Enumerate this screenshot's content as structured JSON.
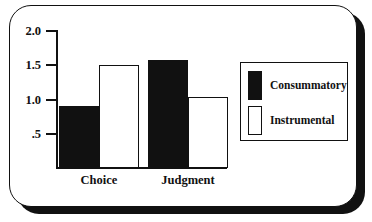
{
  "chart_data": {
    "type": "bar",
    "title": "",
    "xlabel": "",
    "ylabel": "",
    "categories": [
      "Choice",
      "Judgment"
    ],
    "series": [
      {
        "name": "Consummatory",
        "fill": "black",
        "values": [
          0.9,
          1.58
        ]
      },
      {
        "name": "Instrumental",
        "fill": "white",
        "values": [
          1.5,
          1.03
        ]
      }
    ],
    "ylim": [
      0,
      2.0
    ],
    "yticks": [
      2.0,
      1.5,
      1.0,
      0.5
    ],
    "ytick_labels": [
      "2.0",
      "1.5",
      "1.0",
      ".5"
    ],
    "grid": false,
    "legend_position": "right-inside"
  },
  "legend": {
    "entries": [
      {
        "label": "Consummatory",
        "swatch": "filled-square-icon"
      },
      {
        "label": "Instrumental",
        "swatch": "hollow-square-icon"
      }
    ]
  },
  "frame": {
    "style": "rounded-panel-with-drop-shadow",
    "border_color": "#111111",
    "background_color": "#ffffff",
    "shadow_color": "#111111"
  },
  "colors": {
    "ink": "#111111",
    "paper": "#ffffff"
  }
}
